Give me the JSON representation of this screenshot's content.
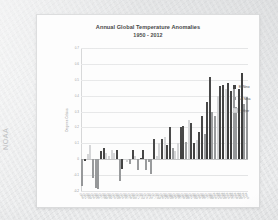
{
  "watermark": "NOAA",
  "chart_data": {
    "type": "bar",
    "title": "Annual Global Temperature Anomalies",
    "subtitle": "1950 - 2012",
    "xlabel": "",
    "ylabel": "Degrees Celsius",
    "ylim": [
      -0.2,
      0.7
    ],
    "yticks": [
      "0.7",
      "0.6",
      "0.5",
      "0.4",
      "0.3",
      "0.2",
      "0.1",
      "0",
      "-0.1",
      "-0.2"
    ],
    "grid": true,
    "legend_position": "right",
    "legend": [
      {
        "name": "El Nino",
        "color": "#2b2b2b"
      },
      {
        "name": "La Nina",
        "color": "#8d8f91"
      },
      {
        "name": "Other",
        "color": "#d2d3d5"
      }
    ],
    "categories": [
      "1950",
      "1951",
      "1952",
      "1953",
      "1954",
      "1955",
      "1956",
      "1957",
      "1958",
      "1959",
      "1960",
      "1961",
      "1962",
      "1963",
      "1964",
      "1965",
      "1966",
      "1967",
      "1968",
      "1969",
      "1970",
      "1971",
      "1972",
      "1973",
      "1974",
      "1975",
      "1976",
      "1977",
      "1978",
      "1979",
      "1980",
      "1981",
      "1982",
      "1983",
      "1984",
      "1985",
      "1986",
      "1987",
      "1988",
      "1989",
      "1990",
      "1991",
      "1992",
      "1993",
      "1994",
      "1995",
      "1996",
      "1997",
      "1998",
      "1999",
      "2000",
      "2001",
      "2002",
      "2003",
      "2004",
      "2005",
      "2006",
      "2007",
      "2008",
      "2009",
      "2010",
      "2011",
      "2012"
    ],
    "points": [
      {
        "year": "1950",
        "value": -0.17,
        "group": "La Nina"
      },
      {
        "year": "1951",
        "value": -0.01,
        "group": "El Nino"
      },
      {
        "year": "1952",
        "value": 0.03,
        "group": "Other"
      },
      {
        "year": "1953",
        "value": 0.09,
        "group": "Other"
      },
      {
        "year": "1954",
        "value": -0.12,
        "group": "La Nina"
      },
      {
        "year": "1955",
        "value": -0.18,
        "group": "La Nina"
      },
      {
        "year": "1956",
        "value": -0.19,
        "group": "La Nina"
      },
      {
        "year": "1957",
        "value": 0.05,
        "group": "El Nino"
      },
      {
        "year": "1958",
        "value": 0.07,
        "group": "El Nino"
      },
      {
        "year": "1959",
        "value": 0.04,
        "group": "Other"
      },
      {
        "year": "1960",
        "value": 0.02,
        "group": "Other"
      },
      {
        "year": "1961",
        "value": 0.06,
        "group": "Other"
      },
      {
        "year": "1962",
        "value": 0.04,
        "group": "Other"
      },
      {
        "year": "1963",
        "value": 0.06,
        "group": "El Nino"
      },
      {
        "year": "1964",
        "value": -0.14,
        "group": "La Nina"
      },
      {
        "year": "1965",
        "value": -0.06,
        "group": "El Nino"
      },
      {
        "year": "1966",
        "value": 0.0,
        "group": "Other"
      },
      {
        "year": "1967",
        "value": -0.02,
        "group": "Other"
      },
      {
        "year": "1968",
        "value": -0.03,
        "group": "La Nina"
      },
      {
        "year": "1969",
        "value": 0.06,
        "group": "El Nino"
      },
      {
        "year": "1970",
        "value": 0.02,
        "group": "Other"
      },
      {
        "year": "1971",
        "value": -0.07,
        "group": "La Nina"
      },
      {
        "year": "1972",
        "value": 0.01,
        "group": "El Nino"
      },
      {
        "year": "1973",
        "value": 0.06,
        "group": "El Nino"
      },
      {
        "year": "1974",
        "value": -0.07,
        "group": "La Nina"
      },
      {
        "year": "1975",
        "value": -0.02,
        "group": "La Nina"
      },
      {
        "year": "1976",
        "value": -0.09,
        "group": "La Nina"
      },
      {
        "year": "1977",
        "value": 0.13,
        "group": "El Nino"
      },
      {
        "year": "1978",
        "value": 0.02,
        "group": "Other"
      },
      {
        "year": "1979",
        "value": 0.1,
        "group": "Other"
      },
      {
        "year": "1980",
        "value": 0.13,
        "group": "El Nino"
      },
      {
        "year": "1981",
        "value": 0.14,
        "group": "Other"
      },
      {
        "year": "1982",
        "value": 0.09,
        "group": "El Nino"
      },
      {
        "year": "1983",
        "value": 0.2,
        "group": "El Nino"
      },
      {
        "year": "1984",
        "value": 0.07,
        "group": "La Nina"
      },
      {
        "year": "1985",
        "value": 0.05,
        "group": "Other"
      },
      {
        "year": "1986",
        "value": 0.1,
        "group": "Other"
      },
      {
        "year": "1987",
        "value": 0.2,
        "group": "El Nino"
      },
      {
        "year": "1988",
        "value": 0.21,
        "group": "El Nino"
      },
      {
        "year": "1989",
        "value": 0.11,
        "group": "La Nina"
      },
      {
        "year": "1990",
        "value": 0.25,
        "group": "Other"
      },
      {
        "year": "1991",
        "value": 0.23,
        "group": "El Nino"
      },
      {
        "year": "1992",
        "value": 0.1,
        "group": "El Nino"
      },
      {
        "year": "1993",
        "value": 0.12,
        "group": "Other"
      },
      {
        "year": "1994",
        "value": 0.17,
        "group": "El Nino"
      },
      {
        "year": "1995",
        "value": 0.27,
        "group": "El Nino"
      },
      {
        "year": "1996",
        "value": 0.16,
        "group": "La Nina"
      },
      {
        "year": "1997",
        "value": 0.36,
        "group": "El Nino"
      },
      {
        "year": "1998",
        "value": 0.52,
        "group": "El Nino"
      },
      {
        "year": "1999",
        "value": 0.3,
        "group": "La Nina"
      },
      {
        "year": "2000",
        "value": 0.27,
        "group": "La Nina"
      },
      {
        "year": "2001",
        "value": 0.4,
        "group": "Other"
      },
      {
        "year": "2002",
        "value": 0.46,
        "group": "El Nino"
      },
      {
        "year": "2003",
        "value": 0.47,
        "group": "El Nino"
      },
      {
        "year": "2004",
        "value": 0.44,
        "group": "Other"
      },
      {
        "year": "2005",
        "value": 0.48,
        "group": "El Nino"
      },
      {
        "year": "2006",
        "value": 0.43,
        "group": "El Nino"
      },
      {
        "year": "2007",
        "value": 0.45,
        "group": "La Nina"
      },
      {
        "year": "2008",
        "value": 0.33,
        "group": "La Nina"
      },
      {
        "year": "2009",
        "value": 0.44,
        "group": "El Nino"
      },
      {
        "year": "2010",
        "value": 0.54,
        "group": "El Nino"
      },
      {
        "year": "2011",
        "value": 0.35,
        "group": "La Nina"
      },
      {
        "year": "2012",
        "value": 0.39,
        "group": "La Nina"
      }
    ]
  }
}
